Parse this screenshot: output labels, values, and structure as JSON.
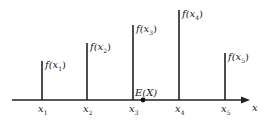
{
  "diagram": {
    "axis_label": "x",
    "expectation_label": "E(X)",
    "expectation_x": 143,
    "axis_y": 100,
    "axis_start": 12,
    "axis_end": 250,
    "colors": {
      "line": "#222222",
      "text": "#222222",
      "background": "#ffffff"
    },
    "points": [
      {
        "x_label": "x",
        "x_sub": "1",
        "f_label": "f(x",
        "f_sub": "1",
        "px": 42,
        "top": 61
      },
      {
        "x_label": "x",
        "x_sub": "2",
        "f_label": "f(x",
        "f_sub": "2",
        "px": 87,
        "top": 43
      },
      {
        "x_label": "x",
        "x_sub": "3",
        "f_label": "f(x",
        "f_sub": "3",
        "px": 133,
        "top": 25
      },
      {
        "x_label": "x",
        "x_sub": "4",
        "f_label": "f(x",
        "f_sub": "4",
        "px": 179,
        "top": 10
      },
      {
        "x_label": "x",
        "x_sub": "5",
        "f_label": "f(x",
        "f_sub": "5",
        "px": 225,
        "top": 53
      }
    ]
  }
}
